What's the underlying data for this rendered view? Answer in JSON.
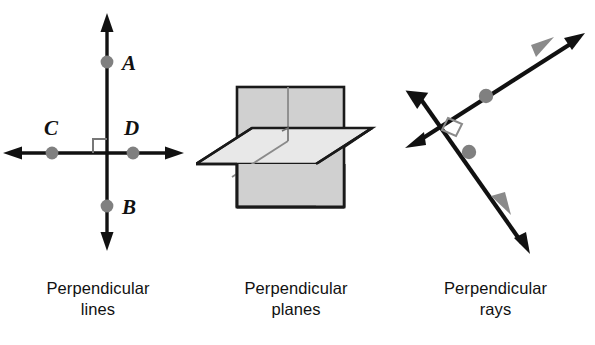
{
  "figure": {
    "background_color": "#ffffff",
    "stroke_color": "#111111",
    "point_color": "#808080",
    "ray_arrow_color": "#808080",
    "plane_vertical_fill": "#d0d0d0",
    "plane_horizontal_fill": "#e8e8e8",
    "plane_edge_color": "#1a1a1a",
    "right_angle_marker_color": "#777777"
  },
  "panels": [
    {
      "id": "lines",
      "caption_line1": "Perpendicular",
      "caption_line2": "lines",
      "point_labels": {
        "a": "A",
        "b": "B",
        "c": "C",
        "d": "D"
      },
      "points": [
        {
          "name": "A",
          "x": 107,
          "y": 62
        },
        {
          "name": "D",
          "x": 133,
          "y": 153
        },
        {
          "name": "C",
          "x": 52,
          "y": 153
        },
        {
          "name": "B",
          "x": 107,
          "y": 206
        }
      ],
      "vertical_line": {
        "x": 107,
        "y1": 18,
        "y2": 245
      },
      "horizontal_line": {
        "y": 153,
        "x1": 6,
        "x2": 180
      },
      "intersection": {
        "x": 107,
        "y": 153
      },
      "right_angle_quadrant": "upper-left"
    },
    {
      "id": "planes",
      "caption_line1": "Perpendicular",
      "caption_line2": "planes",
      "vertical_plane": {
        "left": 41,
        "top": 87,
        "right": 148,
        "bottom": 207
      },
      "horizontal_plane_points": "0,164 56,128 176,128 120,164",
      "fold_line_x": 92,
      "right_angle_marker": {
        "x": 92,
        "y": 141
      }
    },
    {
      "id": "rays",
      "caption_line1": "Perpendicular",
      "caption_line2": "rays",
      "long_line": {
        "x1": 17,
        "y1": 147,
        "x2": 184,
        "y2": 36
      },
      "cross_line": {
        "x1": 17,
        "y1": 89,
        "x2": 131,
        "y2": 252
      },
      "points": [
        {
          "name": "upper-right-ray-point",
          "x": 90,
          "y": 96
        },
        {
          "name": "lower-ray-point",
          "x": 73,
          "y": 152
        }
      ],
      "right_angle_marker": {
        "x": 59,
        "y": 125
      }
    }
  ]
}
